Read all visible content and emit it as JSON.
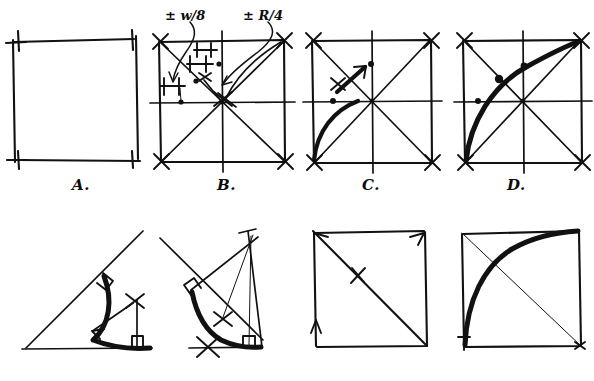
{
  "figure": {
    "background_color": "#ffffff",
    "ink_color": "#111111",
    "width": 594,
    "height": 381,
    "rows": 2,
    "columns": 4
  },
  "annotations": [
    {
      "id": "w8",
      "text": "± w/8",
      "x": 165,
      "y": 10,
      "leader": "curved-arrow-down-left",
      "target_panel": "B"
    },
    {
      "id": "r4",
      "text": "± R/4",
      "x": 243,
      "y": 10,
      "leader": "curved-arrow-down-left",
      "target_panel": "B"
    }
  ],
  "panels": [
    {
      "id": "A",
      "label": "A.",
      "label_x": 72,
      "label_y": 182,
      "row": 1,
      "description": "Plain square outline with overshooting hand-drawn corners",
      "elements": [
        "square-outline"
      ]
    },
    {
      "id": "B",
      "label": "B.",
      "label_x": 217,
      "label_y": 182,
      "row": 1,
      "description": "Square with both diagonals, horizontal and vertical centerlines, dimension ticks marking offsets of plus-or-minus w/8 and plus-or-minus R/4, and located construction dots",
      "elements": [
        "square-outline",
        "diagonals",
        "centerlines",
        "dimension-ticks",
        "construction-dots",
        "center-cross-mark"
      ]
    },
    {
      "id": "C",
      "label": "C.",
      "label_x": 362,
      "label_y": 182,
      "row": 1,
      "description": "Square with diagonals and centerlines; a light arc swept from the left midpoint up to the top centerline with a sweep arrow showing direction",
      "elements": [
        "square-outline",
        "diagonals",
        "centerlines",
        "swept-arc",
        "sweep-arrow",
        "construction-dots"
      ]
    },
    {
      "id": "D",
      "label": "D.",
      "label_x": 507,
      "label_y": 182,
      "row": 1,
      "description": "Square with diagonals and centerlines; the finished bold arc runs from the bottom-left corner through the left-mid point and the diagonal to the top-right corner",
      "elements": [
        "square-outline",
        "diagonals",
        "centerlines",
        "bold-arc",
        "construction-dots"
      ]
    },
    {
      "id": "E",
      "label": "",
      "row": 2,
      "description": "Open wedge of two lines meeting at a vertex on the left; a bold arc tangent to both legs, right-angle squares at both tangent points, an X centre mark with a radius arrow pointing to the arc",
      "elements": [
        "wedge-legs",
        "bold-arc",
        "right-angle-mark",
        "center-cross-mark",
        "radius-arrow",
        "perpendicular-drop"
      ]
    },
    {
      "id": "F",
      "label": "",
      "row": 2,
      "description": "Same wedge construction seen at a steeper angle, with thin construction lines from the apex, two X centre marks, right-angle squares at both tangent points and a bold tangent arc",
      "elements": [
        "wedge-legs",
        "bold-arc",
        "right-angle-mark",
        "center-cross-marks",
        "construction-lines",
        "perpendicular-drop"
      ]
    },
    {
      "id": "G",
      "label": "",
      "row": 2,
      "description": "Square with a single bold diagonal from top-left to bottom-right carrying a single tick mark, plus short arrow strokes at two corners",
      "elements": [
        "square-outline",
        "single-diagonal",
        "tick-mark",
        "corner-arrows"
      ]
    },
    {
      "id": "H",
      "label": "",
      "row": 2,
      "description": "Square with a thin diagonal and a heavy arc bulging from the bottom-left corner up to the top-right corner",
      "elements": [
        "square-outline",
        "thin-diagonal",
        "bold-arc"
      ]
    }
  ]
}
